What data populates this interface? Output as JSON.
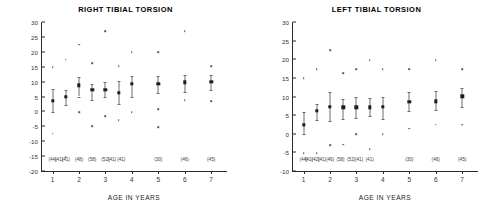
{
  "figure": {
    "xlabel": "AGE IN YEARS",
    "xticks": [
      "1",
      "2",
      "3",
      "4",
      "5",
      "6",
      "7"
    ]
  },
  "chart_data": [
    {
      "type": "scatter",
      "title": "RIGHT TIBIAL TORSION",
      "xlabel": "AGE IN YEARS",
      "ylabel": "",
      "xlim": [
        0.6,
        7.6
      ],
      "ylim": [
        -20,
        30
      ],
      "yticks": [
        30,
        25,
        20,
        15,
        10,
        5,
        0,
        -5,
        -10,
        -15,
        -20
      ],
      "grid": false,
      "legend": "none",
      "x": [
        1,
        1.5,
        2,
        2.5,
        3,
        3.5,
        4,
        5,
        6,
        7
      ],
      "means": [
        3.5,
        4.8,
        8.8,
        7.3,
        7.2,
        6.2,
        9.2,
        9.2,
        9.7,
        10.0
      ],
      "sd_low": [
        -0.3,
        2.3,
        5.0,
        3.7,
        4.8,
        2.6,
        4.7,
        6.3,
        6.6,
        7.3
      ],
      "sd_high": [
        7.4,
        7.3,
        11.5,
        9.1,
        10.0,
        10.3,
        11.8,
        11.8,
        12.2,
        12.2
      ],
      "counts": [
        "(44)",
        "(41)",
        "(41)",
        "(48)",
        "(58)",
        "(52)",
        "(41)",
        "(41)",
        "(30)",
        "(46)",
        "(45)"
      ],
      "count_x": [
        1.0,
        1.25,
        1.5,
        2.0,
        2.5,
        3.0,
        3.25,
        3.6,
        5.0,
        6.0,
        7.0
      ],
      "outliers": [
        {
          "x": 1,
          "y": 14.9
        },
        {
          "x": 1,
          "y": -7.5
        },
        {
          "x": 1.5,
          "y": 17.3
        },
        {
          "x": 1.5,
          "y": -15.4
        },
        {
          "x": 2,
          "y": 22.4
        },
        {
          "x": 2,
          "y": -0.3
        },
        {
          "x": 2.5,
          "y": 16.1
        },
        {
          "x": 2.5,
          "y": -5.0
        },
        {
          "x": 3,
          "y": 26.9
        },
        {
          "x": 3,
          "y": -1.6
        },
        {
          "x": 3.5,
          "y": 15.1
        },
        {
          "x": 3.5,
          "y": -2.9
        },
        {
          "x": 4,
          "y": 19.8
        },
        {
          "x": 4,
          "y": -0.2
        },
        {
          "x": 5,
          "y": 19.8
        },
        {
          "x": 5,
          "y": 0.7
        },
        {
          "x": 5,
          "y": -5.3
        },
        {
          "x": 6,
          "y": 26.9
        },
        {
          "x": 6,
          "y": 3.8
        },
        {
          "x": 7,
          "y": 15.1
        },
        {
          "x": 7,
          "y": 3.5
        }
      ]
    },
    {
      "type": "scatter",
      "title": "LEFT TIBIAL TORSION",
      "xlabel": "AGE IN YEARS",
      "ylabel": "",
      "xlim": [
        0.6,
        7.6
      ],
      "ylim": [
        -10,
        30
      ],
      "yticks": [
        30,
        25,
        20,
        15,
        10,
        5,
        0,
        -5,
        -10
      ],
      "grid": false,
      "legend": "none",
      "x": [
        1,
        1.5,
        2,
        2.5,
        3,
        3.5,
        4,
        5,
        6,
        7
      ],
      "means": [
        2.4,
        6.1,
        7.2,
        7.1,
        7.1,
        7.1,
        7.2,
        8.5,
        8.7,
        10.1
      ],
      "sd_low": [
        -0.2,
        3.6,
        3.3,
        3.9,
        4.3,
        4.8,
        4.0,
        6.0,
        6.3,
        7.3
      ],
      "sd_high": [
        5.9,
        8.0,
        11.2,
        9.2,
        9.8,
        9.6,
        9.8,
        11.3,
        11.6,
        12.3
      ],
      "counts": [
        "(44)",
        "(41)",
        "(42)",
        "(41)",
        "(46)",
        "(58)",
        "(52)",
        "(41)",
        "(41)",
        "(30)",
        "(46)",
        "(45)"
      ],
      "count_x": [
        1.0,
        1.2,
        1.45,
        1.7,
        2.0,
        2.4,
        2.8,
        3.1,
        3.5,
        5.0,
        6.0,
        7.0
      ],
      "outliers": [
        {
          "x": 1,
          "y": 14.9
        },
        {
          "x": 1,
          "y": -5.2
        },
        {
          "x": 1.5,
          "y": 17.4
        },
        {
          "x": 1.5,
          "y": -5.2
        },
        {
          "x": 2,
          "y": 22.4
        },
        {
          "x": 2,
          "y": -3.1
        },
        {
          "x": 2.5,
          "y": 16.2
        },
        {
          "x": 2.5,
          "y": -2.9
        },
        {
          "x": 3,
          "y": 17.4
        },
        {
          "x": 3,
          "y": -0.2
        },
        {
          "x": 3.5,
          "y": 19.8
        },
        {
          "x": 3.5,
          "y": -4.1
        },
        {
          "x": 4,
          "y": 17.4
        },
        {
          "x": 4,
          "y": -0.2
        },
        {
          "x": 5,
          "y": 17.4
        },
        {
          "x": 5,
          "y": 1.4
        },
        {
          "x": 6,
          "y": 19.8
        },
        {
          "x": 6,
          "y": 2.4
        },
        {
          "x": 7,
          "y": 17.4
        },
        {
          "x": 7,
          "y": 2.4
        }
      ]
    }
  ]
}
